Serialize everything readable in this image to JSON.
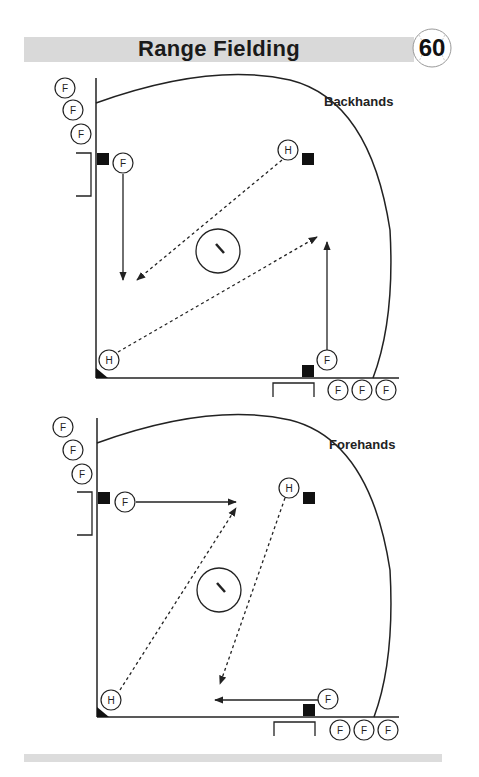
{
  "header": {
    "title": "Range Fielding",
    "page_number": "60",
    "page_icon": "baseball-icon"
  },
  "diagrams": [
    {
      "title": "Backhands",
      "player_labels": {
        "fielder": "F",
        "hitter": "H"
      },
      "elements": {
        "fielder_line_left": [
          "F",
          "F",
          "F"
        ],
        "fielder_line_bottom": [
          "F",
          "F",
          "F"
        ],
        "active_fielder_left": "F",
        "active_fielder_bottom": "F",
        "hitter_top": "H",
        "hitter_home": "H",
        "mound": "pitcher-mound"
      }
    },
    {
      "title": "Forehands",
      "player_labels": {
        "fielder": "F",
        "hitter": "H"
      },
      "elements": {
        "fielder_line_left": [
          "F",
          "F",
          "F"
        ],
        "fielder_line_bottom": [
          "F",
          "F",
          "F"
        ],
        "active_fielder_left": "F",
        "active_fielder_bottom": "F",
        "hitter_top": "H",
        "hitter_home": "H",
        "mound": "pitcher-mound"
      }
    }
  ],
  "colors": {
    "header_bar": "#d9d9d9",
    "line": "#222222",
    "base": "#111111"
  }
}
